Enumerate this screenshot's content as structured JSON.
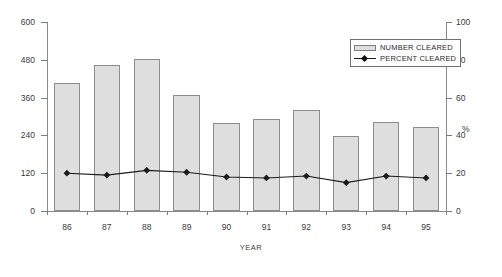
{
  "chart_data": {
    "type": "bar",
    "title": "",
    "xlabel": "YEAR",
    "ylabel": "",
    "y2label": "%",
    "categories": [
      "86",
      "87",
      "88",
      "89",
      "90",
      "91",
      "92",
      "93",
      "94",
      "95"
    ],
    "ylim": [
      0,
      600
    ],
    "y2lim": [
      0,
      100
    ],
    "yticks": [
      "0",
      "120",
      "240",
      "360",
      "480",
      "600"
    ],
    "y2ticks": [
      "0",
      "20",
      "40",
      "60",
      "80",
      "100"
    ],
    "grid": false,
    "legend_position": "top-right",
    "series": [
      {
        "name": "NUMBER CLEARED",
        "type": "bar",
        "axis": "left",
        "values": [
          405,
          462,
          482,
          368,
          278,
          293,
          320,
          237,
          282,
          268
        ]
      },
      {
        "name": "PERCENT CLEARED",
        "type": "line",
        "axis": "right",
        "marker": "diamond",
        "values": [
          20,
          19,
          21.5,
          20.5,
          18,
          17.5,
          18.5,
          15,
          18.5,
          17.5
        ]
      }
    ]
  },
  "legend": {
    "entries": [
      {
        "label": "NUMBER CLEARED",
        "swatch": "bar-swatch"
      },
      {
        "label": "PERCENT CLEARED",
        "swatch": "line-marker-swatch"
      }
    ]
  },
  "axes": {
    "x_title": "YEAR",
    "y2_title": "%"
  },
  "colors": {
    "bar_fill": "#dedede",
    "bar_stroke": "#8d8d8d",
    "line": "#1a1a1a",
    "axis": "#8a8a8a",
    "text": "#3a3a3a",
    "background": "#ffffff"
  }
}
